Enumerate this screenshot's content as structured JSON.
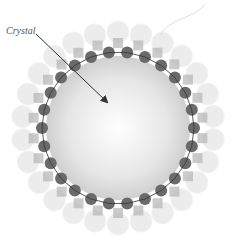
{
  "diagram": {
    "label": "Crystal",
    "center": [
      118,
      128
    ],
    "crystal_radius": 72,
    "bead_ring_radius": 76,
    "inner_bead_count": 26,
    "outer_ring_radius": 96,
    "outer_bead_count": 26,
    "colors": {
      "crystal_center": "#ffffff",
      "crystal_edge": "#cfcfcf",
      "dark_bead": "#6a6a6a",
      "mid_bead": "#b5b5b5",
      "light_bead": "#e8e8e8",
      "tether": "#333333",
      "arrow": "#333333",
      "label": "#555555"
    }
  }
}
